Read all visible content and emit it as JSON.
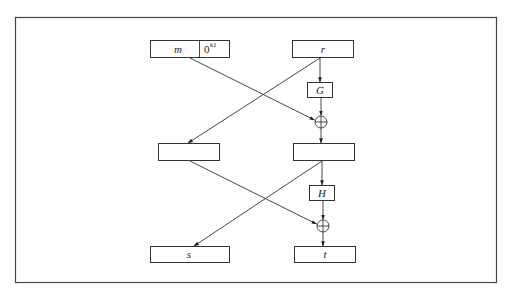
{
  "diagram": {
    "title": "",
    "type": "OAEP padding scheme (two-round Feistel with G and H)",
    "inputs": {
      "message_label": "m",
      "padding_label": "0",
      "padding_superscript": "k1",
      "random_label": "r"
    },
    "functions": {
      "g_label": "G",
      "h_label": "H"
    },
    "intermediate": {
      "left_label": "",
      "right_label": ""
    },
    "outputs": {
      "s_label": "s",
      "t_label": "t"
    },
    "operators": [
      "xor",
      "xor"
    ],
    "edges": [
      {
        "from": "m||0^k1",
        "to": "xor-1"
      },
      {
        "from": "r",
        "to": "G"
      },
      {
        "from": "G",
        "to": "xor-1"
      },
      {
        "from": "r",
        "to": "left-middle"
      },
      {
        "from": "xor-1",
        "to": "right-middle"
      },
      {
        "from": "right-middle",
        "to": "H"
      },
      {
        "from": "H",
        "to": "xor-2"
      },
      {
        "from": "left-middle",
        "to": "xor-2"
      },
      {
        "from": "right-middle",
        "to": "s"
      },
      {
        "from": "xor-2",
        "to": "t"
      }
    ],
    "colors": {
      "stroke": "#333333",
      "background": "#ffffff"
    }
  }
}
